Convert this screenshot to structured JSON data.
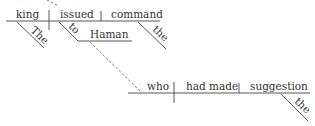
{
  "diagram": {
    "type": "sentence-diagram",
    "main_clause": {
      "subject": "king",
      "subject_modifier": "The",
      "verb": "issued",
      "indirect_object_preposition": "to",
      "indirect_object": "Haman",
      "direct_object": "command",
      "direct_object_modifier": "the"
    },
    "relative_clause": {
      "subject": "who",
      "verb": "had made",
      "direct_object": "suggestion",
      "direct_object_modifier": "the"
    }
  }
}
